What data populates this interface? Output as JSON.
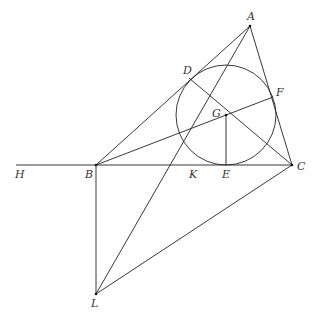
{
  "diagram": {
    "line_color": "#222222",
    "points": [
      {
        "id": "A",
        "x": 250,
        "y": 26,
        "lx": 247,
        "ly": 20
      },
      {
        "id": "B",
        "x": 96,
        "y": 165,
        "lx": 85,
        "ly": 178
      },
      {
        "id": "C",
        "x": 292,
        "y": 165,
        "lx": 297,
        "ly": 170
      },
      {
        "id": "D",
        "x": 189,
        "y": 78,
        "lx": 183,
        "ly": 74
      },
      {
        "id": "E",
        "x": 226,
        "y": 165,
        "lx": 222,
        "ly": 178
      },
      {
        "id": "F",
        "x": 273,
        "y": 97,
        "lx": 276,
        "ly": 96
      },
      {
        "id": "G",
        "x": 226,
        "y": 115,
        "lx": 212,
        "ly": 117
      },
      {
        "id": "H",
        "x": 16,
        "y": 165,
        "lx": 15,
        "ly": 178
      },
      {
        "id": "K",
        "x": 193,
        "y": 165,
        "lx": 189,
        "ly": 178
      },
      {
        "id": "L",
        "x": 96,
        "y": 294,
        "lx": 91,
        "ly": 307
      }
    ],
    "circle": {
      "cx": 226,
      "cy": 115,
      "r": 50
    },
    "segments": [
      [
        "H",
        "C"
      ],
      [
        "A",
        "B"
      ],
      [
        "A",
        "C"
      ],
      [
        "A",
        "L"
      ],
      [
        "B",
        "F"
      ],
      [
        "C",
        "D"
      ],
      [
        "G",
        "E"
      ],
      [
        "B",
        "L"
      ],
      [
        "L",
        "C"
      ]
    ]
  }
}
